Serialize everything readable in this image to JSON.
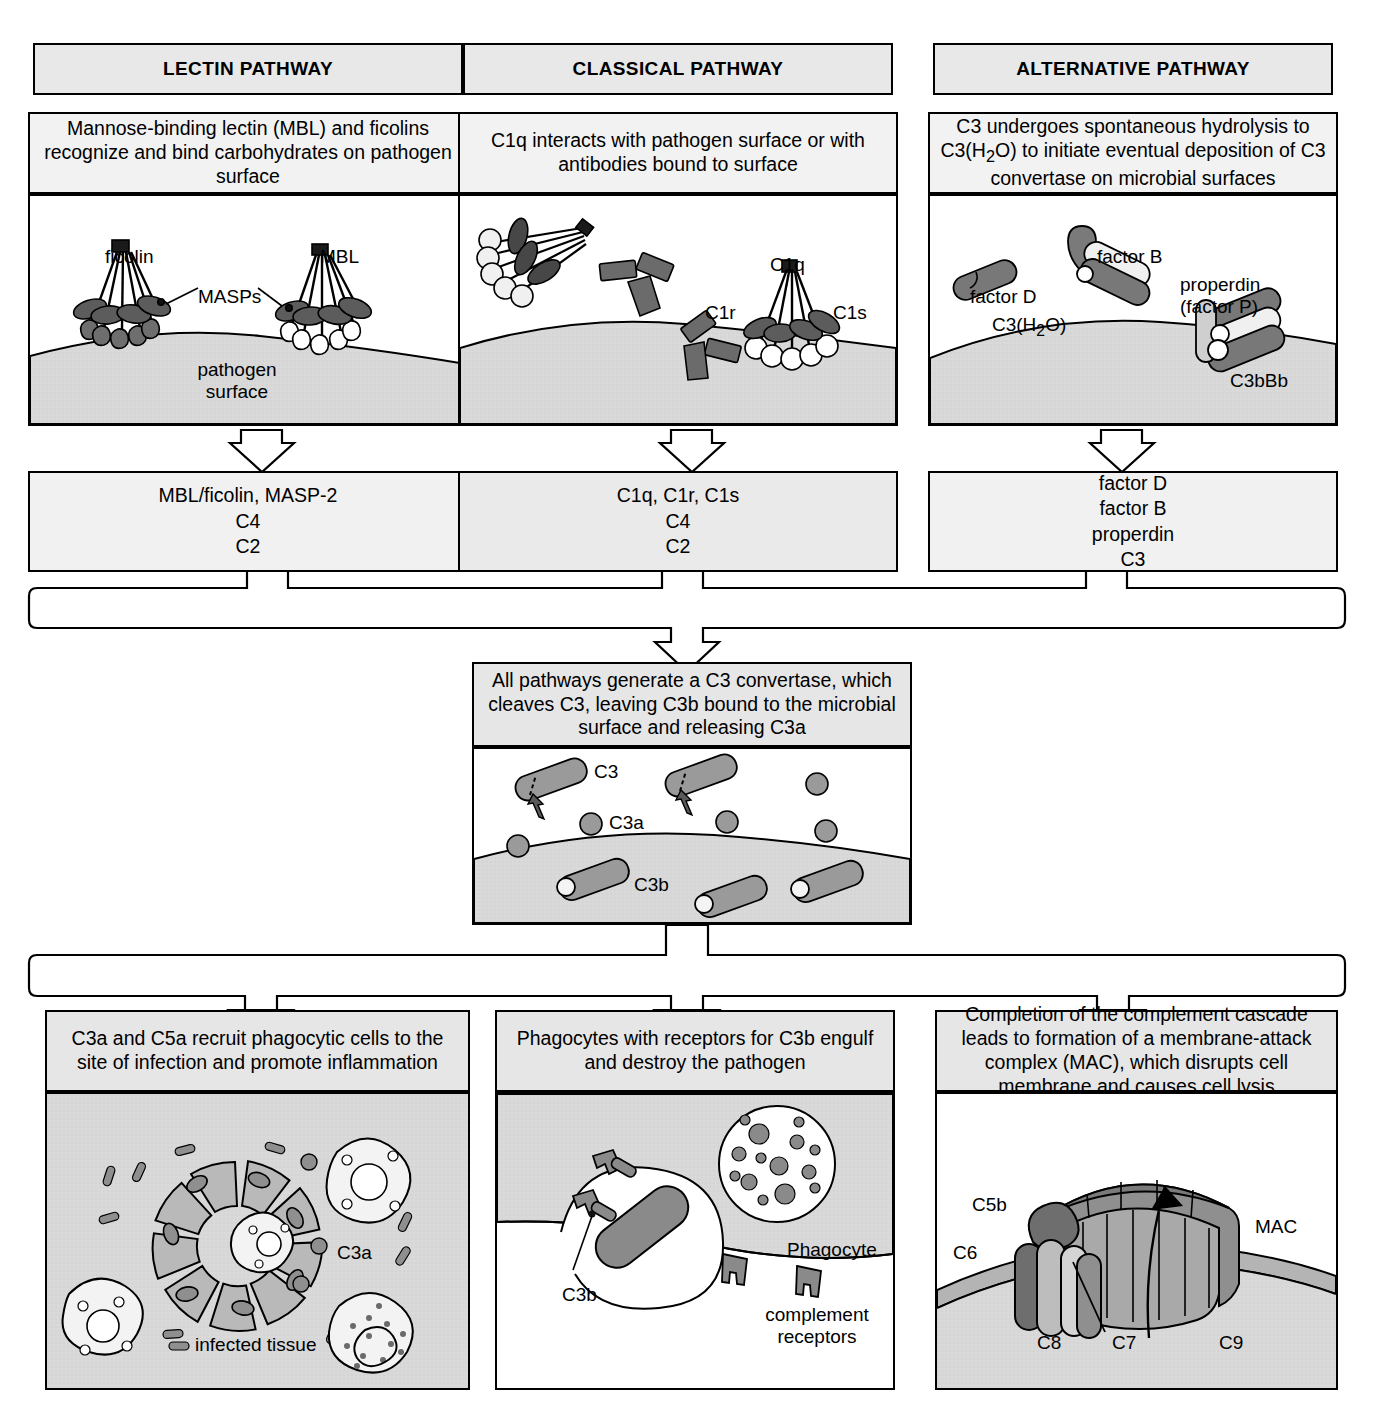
{
  "diagram": {
    "colors": {
      "outline": "#000000",
      "title_fill": "#e8e8e8",
      "desc_fill": "#e6e6e6",
      "art_fill": "#ffffff",
      "surface_fill": "#d4d4d4",
      "protein_dark": "#595959",
      "protein_mid": "#808080",
      "protein_light": "#f2f2f2"
    }
  },
  "pathways": [
    {
      "id": "lectin",
      "title": "LECTIN PATHWAY",
      "description": "Mannose-binding lectin (MBL) and ficolins recognize and bind carbohydrates on pathogen surface",
      "art_labels": [
        "ficolin",
        "MBL",
        "MASPs",
        "pathogen surface"
      ],
      "components": [
        "MBL/ficolin, MASP-2",
        "C4",
        "C2"
      ]
    },
    {
      "id": "classical",
      "title": "CLASSICAL PATHWAY",
      "description": "C1q interacts with pathogen surface or with antibodies bound to surface",
      "art_labels": [
        "C1q",
        "C1r",
        "C1s"
      ],
      "components": [
        "C1q, C1r, C1s",
        "C4",
        "C2"
      ]
    },
    {
      "id": "alternative",
      "title": "ALTERNATIVE PATHWAY",
      "description": "C3 undergoes spontaneous hydrolysis to C3(H2O) to initiate eventual deposition of C3 convertase on microbial surfaces",
      "art_labels": [
        "factor D",
        "factor B",
        "C3(H2O)",
        "properdin (factor P)",
        "C3bBb"
      ],
      "components": [
        "factor D",
        "factor B",
        "properdin",
        "C3"
      ]
    }
  ],
  "center": {
    "description": "All pathways generate a C3 convertase, which cleaves C3, leaving C3b bound to the microbial surface and releasing C3a",
    "art_labels": [
      "C3",
      "C3a",
      "C3b"
    ]
  },
  "outcomes": [
    {
      "id": "inflammation",
      "description": "C3a and C5a recruit phagocytic cells to the site of infection and promote inflammation",
      "art_labels": [
        "C3a",
        "infected tissue"
      ]
    },
    {
      "id": "phagocytosis",
      "description": "Phagocytes with receptors for C3b engulf and destroy the pathogen",
      "art_labels": [
        "C3b",
        "Phagocyte",
        "complement receptors"
      ]
    },
    {
      "id": "lysis",
      "description": "Completion of the complement cascade leads to formation of a membrane-attack complex (MAC), which disrupts cell membrane and causes cell lysis",
      "art_labels": [
        "C5b",
        "C6",
        "C7",
        "C8",
        "C9",
        "MAC"
      ]
    }
  ]
}
